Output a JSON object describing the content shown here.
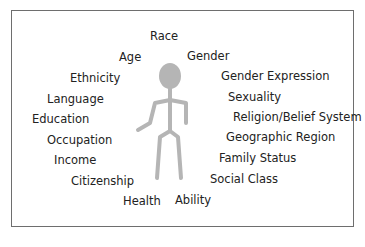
{
  "diagram": {
    "type": "identity-wheel",
    "center_figure": "stick-figure-person",
    "figure_color": "#b5b5b5",
    "border_color": "#6e6e6e",
    "text_color": "#222222",
    "labels": {
      "race": "Race",
      "age": "Age",
      "gender": "Gender",
      "ethnicity": "Ethnicity",
      "gender_expression": "Gender Expression",
      "language": "Language",
      "sexuality": "Sexuality",
      "education": "Education",
      "religion": "Religion/Belief System",
      "occupation": "Occupation",
      "geographic_region": "Geographic Region",
      "income": "Income",
      "family_status": "Family Status",
      "citizenship": "Citizenship",
      "social_class": "Social Class",
      "health": "Health",
      "ability": "Ability"
    }
  }
}
